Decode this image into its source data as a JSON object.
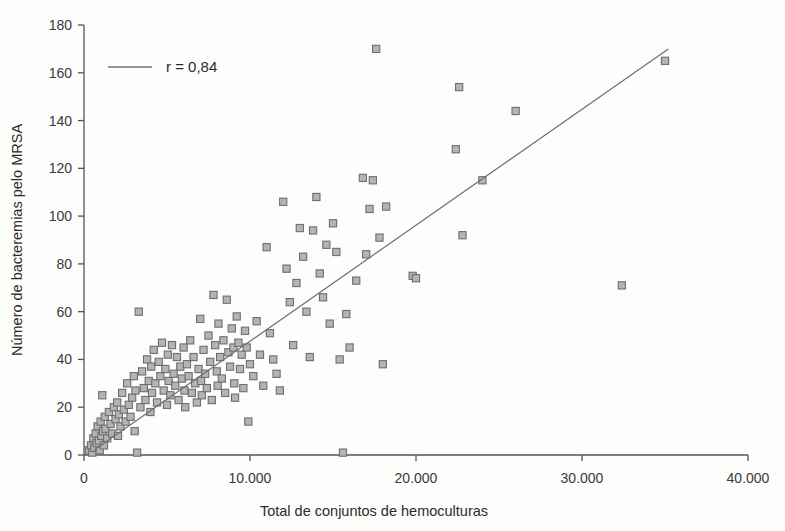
{
  "chart_data": {
    "type": "scatter",
    "title": "",
    "xlabel": "Total de conjuntos de hemoculturas",
    "ylabel": "Número de bacteremias pelo MRSA",
    "xlim": [
      0,
      40000
    ],
    "ylim": [
      0,
      180
    ],
    "grid": false,
    "legend_position": "top-left",
    "legend": [
      {
        "label": "r = 0,84",
        "marker": "line",
        "color": "#707070"
      }
    ],
    "annotations": [
      {
        "text": "r = 0,84",
        "type": "correlation-coefficient"
      }
    ],
    "xticks": [
      0,
      10000,
      20000,
      30000,
      40000
    ],
    "xtick_labels": [
      "0",
      "10.000",
      "20.000",
      "30.000",
      "40.000"
    ],
    "yticks": [
      0,
      20,
      40,
      60,
      80,
      100,
      120,
      140,
      160,
      180
    ],
    "ytick_labels": [
      "0",
      "20",
      "40",
      "60",
      "80",
      "100",
      "120",
      "140",
      "160",
      "180"
    ],
    "series": [
      {
        "name": "Hospitais",
        "marker": "square",
        "marker_fill": "#b4b4b4",
        "marker_edge": "#6e6e6e",
        "points": [
          [
            300,
            2
          ],
          [
            420,
            4
          ],
          [
            500,
            1
          ],
          [
            560,
            7
          ],
          [
            620,
            3
          ],
          [
            700,
            9
          ],
          [
            760,
            5
          ],
          [
            820,
            12
          ],
          [
            900,
            6
          ],
          [
            950,
            2
          ],
          [
            1000,
            14
          ],
          [
            1050,
            8
          ],
          [
            1100,
            25
          ],
          [
            1150,
            10
          ],
          [
            1200,
            4
          ],
          [
            1250,
            16
          ],
          [
            1300,
            11
          ],
          [
            1400,
            7
          ],
          [
            1500,
            18
          ],
          [
            1600,
            13
          ],
          [
            1700,
            9
          ],
          [
            1800,
            20
          ],
          [
            1900,
            15
          ],
          [
            2000,
            22
          ],
          [
            2050,
            8
          ],
          [
            2100,
            17
          ],
          [
            2200,
            12
          ],
          [
            2300,
            26
          ],
          [
            2400,
            19
          ],
          [
            2500,
            14
          ],
          [
            2600,
            30
          ],
          [
            2700,
            21
          ],
          [
            2800,
            16
          ],
          [
            2900,
            24
          ],
          [
            3000,
            33
          ],
          [
            3050,
            10
          ],
          [
            3100,
            27
          ],
          [
            3200,
            1
          ],
          [
            3300,
            60
          ],
          [
            3400,
            20
          ],
          [
            3500,
            35
          ],
          [
            3600,
            28
          ],
          [
            3700,
            23
          ],
          [
            3800,
            40
          ],
          [
            3900,
            31
          ],
          [
            4000,
            18
          ],
          [
            4050,
            37
          ],
          [
            4100,
            26
          ],
          [
            4200,
            44
          ],
          [
            4300,
            30
          ],
          [
            4400,
            22
          ],
          [
            4500,
            39
          ],
          [
            4600,
            33
          ],
          [
            4700,
            47
          ],
          [
            4800,
            27
          ],
          [
            4900,
            36
          ],
          [
            5000,
            21
          ],
          [
            5050,
            42
          ],
          [
            5100,
            31
          ],
          [
            5200,
            25
          ],
          [
            5300,
            46
          ],
          [
            5400,
            34
          ],
          [
            5500,
            29
          ],
          [
            5600,
            41
          ],
          [
            5700,
            23
          ],
          [
            5800,
            37
          ],
          [
            5900,
            32
          ],
          [
            6000,
            45
          ],
          [
            6050,
            27
          ],
          [
            6100,
            20
          ],
          [
            6200,
            38
          ],
          [
            6300,
            33
          ],
          [
            6400,
            48
          ],
          [
            6500,
            26
          ],
          [
            6600,
            41
          ],
          [
            6700,
            30
          ],
          [
            6800,
            22
          ],
          [
            6900,
            36
          ],
          [
            7000,
            57
          ],
          [
            7050,
            31
          ],
          [
            7100,
            25
          ],
          [
            7200,
            44
          ],
          [
            7300,
            34
          ],
          [
            7400,
            28
          ],
          [
            7500,
            50
          ],
          [
            7600,
            39
          ],
          [
            7700,
            23
          ],
          [
            7800,
            67
          ],
          [
            7900,
            46
          ],
          [
            8000,
            35
          ],
          [
            8050,
            29
          ],
          [
            8100,
            55
          ],
          [
            8200,
            41
          ],
          [
            8300,
            32
          ],
          [
            8400,
            48
          ],
          [
            8500,
            26
          ],
          [
            8600,
            65
          ],
          [
            8700,
            43
          ],
          [
            8800,
            37
          ],
          [
            8900,
            53
          ],
          [
            9000,
            45
          ],
          [
            9050,
            30
          ],
          [
            9100,
            24
          ],
          [
            9200,
            58
          ],
          [
            9300,
            47
          ],
          [
            9400,
            36
          ],
          [
            9500,
            42
          ],
          [
            9600,
            28
          ],
          [
            9700,
            52
          ],
          [
            9800,
            45
          ],
          [
            9900,
            14
          ],
          [
            10000,
            38
          ],
          [
            10200,
            33
          ],
          [
            10400,
            56
          ],
          [
            10600,
            42
          ],
          [
            10800,
            29
          ],
          [
            11000,
            87
          ],
          [
            11200,
            51
          ],
          [
            11400,
            40
          ],
          [
            11600,
            34
          ],
          [
            11800,
            27
          ],
          [
            12000,
            106
          ],
          [
            12200,
            78
          ],
          [
            12400,
            64
          ],
          [
            12600,
            46
          ],
          [
            12800,
            72
          ],
          [
            13000,
            95
          ],
          [
            13200,
            83
          ],
          [
            13400,
            60
          ],
          [
            13600,
            41
          ],
          [
            13800,
            94
          ],
          [
            14000,
            108
          ],
          [
            14200,
            76
          ],
          [
            14400,
            66
          ],
          [
            14600,
            88
          ],
          [
            14800,
            55
          ],
          [
            15000,
            97
          ],
          [
            15200,
            85
          ],
          [
            15400,
            40
          ],
          [
            15600,
            1
          ],
          [
            15800,
            59
          ],
          [
            16000,
            45
          ],
          [
            16400,
            73
          ],
          [
            16800,
            116
          ],
          [
            17000,
            84
          ],
          [
            17200,
            103
          ],
          [
            17400,
            115
          ],
          [
            17600,
            170
          ],
          [
            17800,
            91
          ],
          [
            18000,
            38
          ],
          [
            18200,
            104
          ],
          [
            19800,
            75
          ],
          [
            20000,
            74
          ],
          [
            22400,
            128
          ],
          [
            22600,
            154
          ],
          [
            22800,
            92
          ],
          [
            24000,
            115
          ],
          [
            26000,
            144
          ],
          [
            32400,
            71
          ],
          [
            35000,
            165
          ]
        ]
      }
    ],
    "trendline": {
      "name": "Linha de tendência",
      "color": "#6e6e6e",
      "x_start": 600,
      "y_start": 2,
      "x_end": 35200,
      "y_end": 170
    }
  }
}
